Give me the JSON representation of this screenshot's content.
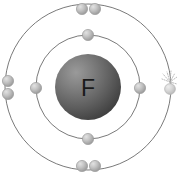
{
  "diagram": {
    "kind": "bohr-atomic-model",
    "background_color": "#ffffff",
    "width": 177,
    "height": 174,
    "center": {
      "x": 88,
      "y": 87
    }
  },
  "nucleus": {
    "symbol": "F",
    "element_name": "Fluorine",
    "radius": 33,
    "fill_light": "#8e8e8e",
    "fill_mid": "#6b6b6b",
    "fill_dark": "#4a4a4a",
    "label_color": "#1a1a1a",
    "label_font_size": 23,
    "highlight": {
      "x": 76,
      "y": 72
    }
  },
  "shells": [
    {
      "name": "inner-shell",
      "index": 1,
      "radius": 52,
      "stroke_color": "#7a7a7a",
      "stroke_width": 1,
      "electron_count": 4
    },
    {
      "name": "outer-shell",
      "index": 2,
      "radius": 83,
      "stroke_color": "#7a7a7a",
      "stroke_width": 1,
      "electron_count": 7
    }
  ],
  "electron_style": {
    "radius": 5.6,
    "fill_light": "#d2d2d2",
    "fill_mid": "#b4b4b4",
    "fill_dark": "#8f8f8f",
    "stroke_color": "#9b9b9b"
  },
  "electrons": [
    {
      "id": "inner-top",
      "shell": "inner-shell",
      "x": 88,
      "y": 35,
      "label": "inner shell electron top"
    },
    {
      "id": "inner-left",
      "shell": "inner-shell",
      "x": 36,
      "y": 88,
      "label": "inner shell electron left"
    },
    {
      "id": "inner-right",
      "shell": "inner-shell",
      "x": 140,
      "y": 88,
      "label": "inner shell electron right"
    },
    {
      "id": "inner-bottom",
      "shell": "inner-shell",
      "x": 88,
      "y": 139,
      "label": "inner shell electron bottom"
    },
    {
      "id": "outer-top-left",
      "shell": "outer-shell",
      "x": 82,
      "y": 9,
      "label": "outer shell electron top left"
    },
    {
      "id": "outer-top-right",
      "shell": "outer-shell",
      "x": 95,
      "y": 9,
      "label": "outer shell electron top right"
    },
    {
      "id": "outer-left-upper",
      "shell": "outer-shell",
      "x": 8,
      "y": 81,
      "label": "outer shell electron left upper"
    },
    {
      "id": "outer-left-lower",
      "shell": "outer-shell",
      "x": 8,
      "y": 94,
      "label": "outer shell electron left lower"
    },
    {
      "id": "outer-bottom-left",
      "shell": "outer-shell",
      "x": 82,
      "y": 166,
      "label": "outer shell electron bottom left"
    },
    {
      "id": "outer-bottom-right",
      "shell": "outer-shell",
      "x": 95,
      "y": 166,
      "label": "outer shell electron bottom right"
    },
    {
      "id": "outer-right-marked",
      "shell": "outer-shell",
      "x": 170,
      "y": 89,
      "label": "outer shell electron right, marked"
    }
  ],
  "marker": {
    "name": "sparkle-marker",
    "target_electron": "outer-right-marked",
    "x": 170,
    "y": 83,
    "stroke_color": "#a8a8a8",
    "ray_count": 7,
    "description": "faint dashed radiating rays above right outer electron"
  }
}
